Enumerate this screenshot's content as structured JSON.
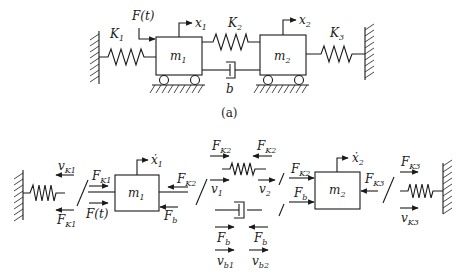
{
  "figure": {
    "caption_a": "(a)",
    "top": {
      "springs": [
        {
          "base": "K",
          "sub": "1"
        },
        {
          "base": "K",
          "sub": "2"
        },
        {
          "base": "K",
          "sub": "3"
        }
      ],
      "masses": [
        {
          "base": "m",
          "sub": "1"
        },
        {
          "base": "m",
          "sub": "2"
        }
      ],
      "force": "F(t)",
      "damper": "b",
      "displacements": [
        {
          "base": "x",
          "sub": "1"
        },
        {
          "base": "x",
          "sub": "2"
        }
      ]
    },
    "bottom": {
      "left_spring": {
        "v_base": "v",
        "v_sub": "K1",
        "f_base": "F",
        "f_sub": "K1"
      },
      "mass1": {
        "label_base": "m",
        "label_sub": "1",
        "velocity_base": "ẋ",
        "velocity_sub": "1",
        "fk1_base": "F",
        "fk1_sub": "K1",
        "ft": "F(t)",
        "fk2_base": "F",
        "fk2_sub": "K2",
        "fb_base": "F",
        "fb_sub": "b"
      },
      "spring2": {
        "fl_base": "F",
        "fl_sub": "K2",
        "fr_base": "F",
        "fr_sub": "K2",
        "v1_base": "v",
        "v1_sub": "1",
        "v2_base": "v",
        "v2_sub": "2"
      },
      "damper": {
        "fl_base": "F",
        "fl_sub": "b",
        "fr_base": "F",
        "fr_sub": "b",
        "vb1_base": "v",
        "vb1_sub": "b1",
        "vb2_base": "v",
        "vb2_sub": "b2"
      },
      "mass2": {
        "label_base": "m",
        "label_sub": "2",
        "velocity_base": "ẋ",
        "velocity_sub": "2",
        "fk2_base": "F",
        "fk2_sub": "K2",
        "fb_base": "F",
        "fb_sub": "b",
        "fk3_base": "F",
        "fk3_sub": "K3"
      },
      "right_spring": {
        "f_base": "F",
        "f_sub": "K3",
        "v_base": "v",
        "v_sub": "K3"
      }
    }
  }
}
